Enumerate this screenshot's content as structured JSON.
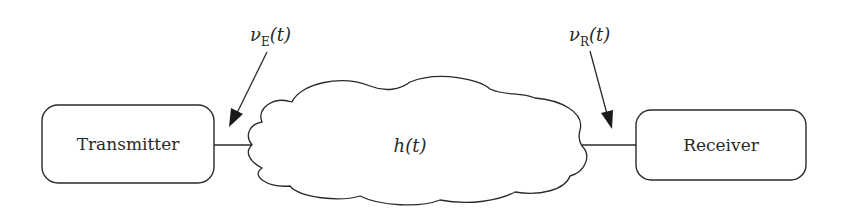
{
  "diagram": {
    "type": "block-diagram",
    "nodes": [
      {
        "id": "transmitter",
        "label": "Transmitter",
        "shape": "rounded-rectangle"
      },
      {
        "id": "channel",
        "label": "h(t)",
        "label_main": "h",
        "label_arg": "(t)",
        "shape": "cloud"
      },
      {
        "id": "receiver",
        "label": "Receiver",
        "shape": "rounded-rectangle"
      }
    ],
    "edges": [
      {
        "from": "transmitter",
        "to": "channel"
      },
      {
        "from": "channel",
        "to": "receiver"
      }
    ],
    "annotations": [
      {
        "id": "vE",
        "label": "νE(t)",
        "symbol": "ν",
        "subscript": "E",
        "arg": "(t)",
        "points_to": "transmitter-channel link"
      },
      {
        "id": "vR",
        "label": "νR(t)",
        "symbol": "ν",
        "subscript": "R",
        "arg": "(t)",
        "points_to": "channel-receiver link"
      }
    ]
  },
  "colors": {
    "stroke": "#2a2a2a",
    "background": "#ffffff"
  }
}
